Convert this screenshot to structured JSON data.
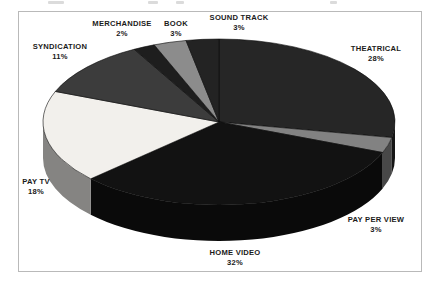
{
  "chart_data": {
    "type": "pie",
    "title": "",
    "subtitle": "",
    "xlabel": "",
    "ylabel": "",
    "legend_position": "none",
    "grid": false,
    "style": "3d-pie",
    "start_angle_deg": 0,
    "direction": "clockwise",
    "categories": [
      "THEATRICAL",
      "PAY PER VIEW",
      "HOME VIDEO",
      "PAY TV",
      "SYNDICATION",
      "MERCHANDISE",
      "BOOK",
      "SOUND TRACK"
    ],
    "values": [
      28,
      3,
      32,
      18,
      11,
      2,
      3,
      3
    ],
    "value_labels": [
      "28%",
      "3%",
      "32%",
      "18%",
      "11%",
      "2%",
      "3%",
      "3%"
    ],
    "unit": "%",
    "total": 100,
    "slice_colors": [
      "#262626",
      "#828282",
      "#121212",
      "#f2f0ec",
      "#3c3c3c",
      "#1e1e1e",
      "#8c8c8c",
      "#232323"
    ],
    "slices": [
      {
        "label": "THEATRICAL",
        "value": 28,
        "value_label": "28%",
        "color": "#262626"
      },
      {
        "label": "PAY PER VIEW",
        "value": 3,
        "value_label": "3%",
        "color": "#828282"
      },
      {
        "label": "HOME VIDEO",
        "value": 32,
        "value_label": "32%",
        "color": "#121212"
      },
      {
        "label": "PAY TV",
        "value": 18,
        "value_label": "18%",
        "color": "#f2f0ec"
      },
      {
        "label": "SYNDICATION",
        "value": 11,
        "value_label": "11%",
        "color": "#3c3c3c"
      },
      {
        "label": "MERCHANDISE",
        "value": 2,
        "value_label": "2%",
        "color": "#1e1e1e"
      },
      {
        "label": "BOOK",
        "value": 3,
        "value_label": "3%",
        "color": "#8c8c8c"
      },
      {
        "label": "SOUND TRACK",
        "value": 3,
        "value_label": "3%",
        "color": "#232323"
      }
    ]
  },
  "labels": {
    "theatrical": {
      "name": "THEATRICAL",
      "pct": "28%"
    },
    "pay_per_view": {
      "name": "PAY PER VIEW",
      "pct": "3%"
    },
    "home_video": {
      "name": "HOME VIDEO",
      "pct": "32%"
    },
    "pay_tv": {
      "name": "PAY TV",
      "pct": "18%"
    },
    "syndication": {
      "name": "SYNDICATION",
      "pct": "11%"
    },
    "merchandise": {
      "name": "MERCHANDISE",
      "pct": "2%"
    },
    "book": {
      "name": "BOOK",
      "pct": "3%"
    },
    "sound_track": {
      "name": "SOUND TRACK",
      "pct": "3%"
    }
  },
  "frame": {
    "border_color": "#b9b9b9",
    "background": "#ffffff"
  }
}
